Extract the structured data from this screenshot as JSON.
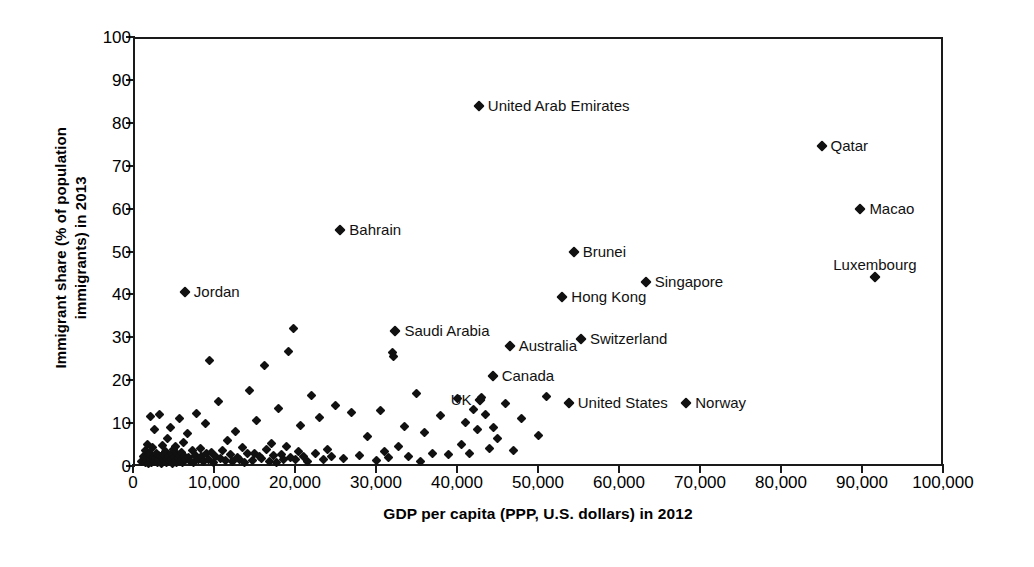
{
  "chart_data": {
    "type": "scatter",
    "title": "",
    "xlabel": "GDP per capita (PPP, U.S. dollars) in 2012",
    "ylabel": "Immigrant share (% of population\nimmigrants) in 2013",
    "ylabel_line1": "Immigrant share (% of population",
    "ylabel_line2": "immigrants) in 2013",
    "xlim": [
      0,
      100000
    ],
    "ylim": [
      0,
      100
    ],
    "xticks": [
      0,
      10000,
      20000,
      30000,
      40000,
      50000,
      60000,
      70000,
      80000,
      90000,
      100000
    ],
    "xtick_labels": [
      "0",
      "10,000",
      "20,000",
      "30,000",
      "40,000",
      "50,000",
      "60,000",
      "70,000",
      "80,000",
      "90,000",
      "100,000"
    ],
    "yticks": [
      0,
      10,
      20,
      30,
      40,
      50,
      60,
      70,
      80,
      90,
      100
    ],
    "ytick_labels": [
      "0",
      "10",
      "20",
      "30",
      "40",
      "50",
      "60",
      "70",
      "80",
      "90",
      "100"
    ],
    "grid": false,
    "legend": null,
    "marker_color": "#111111",
    "marker_shape": "diamond",
    "labeled_points": [
      {
        "name": "United Arab Emirates",
        "x": 42700,
        "y": 84.0,
        "label_side": "right"
      },
      {
        "name": "Qatar",
        "x": 85000,
        "y": 74.5,
        "label_side": "right"
      },
      {
        "name": "Macao",
        "x": 89800,
        "y": 60.0,
        "label_side": "right"
      },
      {
        "name": "Luxembourg",
        "x": 91600,
        "y": 44.0,
        "label_side": "above"
      },
      {
        "name": "Bahrain",
        "x": 25600,
        "y": 55.0,
        "label_side": "right"
      },
      {
        "name": "Brunei",
        "x": 54400,
        "y": 50.0,
        "label_side": "right"
      },
      {
        "name": "Singapore",
        "x": 63300,
        "y": 43.0,
        "label_side": "right"
      },
      {
        "name": "Hong Kong",
        "x": 53000,
        "y": 39.5,
        "label_side": "right"
      },
      {
        "name": "Jordan",
        "x": 6400,
        "y": 40.5,
        "label_side": "right"
      },
      {
        "name": "Saudi Arabia",
        "x": 32400,
        "y": 31.5,
        "label_side": "right"
      },
      {
        "name": "Switzerland",
        "x": 55300,
        "y": 29.5,
        "label_side": "right"
      },
      {
        "name": "Australia",
        "x": 46500,
        "y": 28.0,
        "label_side": "right"
      },
      {
        "name": "Canada",
        "x": 44400,
        "y": 21.0,
        "label_side": "right"
      },
      {
        "name": "UK",
        "x": 42900,
        "y": 15.5,
        "label_side": "left"
      },
      {
        "name": "United States",
        "x": 53800,
        "y": 14.8,
        "label_side": "right"
      },
      {
        "name": "Norway",
        "x": 68300,
        "y": 14.8,
        "label_side": "right"
      }
    ],
    "unlabeled_points": [
      [
        1100,
        1.0
      ],
      [
        1300,
        2.2
      ],
      [
        1500,
        0.8
      ],
      [
        1600,
        3.5
      ],
      [
        1700,
        1.2
      ],
      [
        1800,
        5.0
      ],
      [
        1900,
        0.6
      ],
      [
        2000,
        2.8
      ],
      [
        2100,
        1.5
      ],
      [
        2200,
        11.5
      ],
      [
        2300,
        0.9
      ],
      [
        2400,
        4.2
      ],
      [
        2500,
        2.0
      ],
      [
        2600,
        1.1
      ],
      [
        2700,
        8.5
      ],
      [
        2800,
        1.8
      ],
      [
        2900,
        3.0
      ],
      [
        3000,
        0.7
      ],
      [
        3100,
        2.5
      ],
      [
        3200,
        1.4
      ],
      [
        3300,
        12.0
      ],
      [
        3400,
        2.1
      ],
      [
        3500,
        0.5
      ],
      [
        3600,
        4.8
      ],
      [
        3700,
        1.9
      ],
      [
        3800,
        2.6
      ],
      [
        3900,
        1.0
      ],
      [
        4000,
        3.3
      ],
      [
        4100,
        0.8
      ],
      [
        4200,
        6.5
      ],
      [
        4300,
        1.6
      ],
      [
        4400,
        2.3
      ],
      [
        4500,
        1.2
      ],
      [
        4600,
        9.0
      ],
      [
        4700,
        2.9
      ],
      [
        4800,
        1.5
      ],
      [
        4900,
        0.6
      ],
      [
        5000,
        3.8
      ],
      [
        5100,
        2.0
      ],
      [
        5200,
        1.3
      ],
      [
        5300,
        4.5
      ],
      [
        5400,
        0.9
      ],
      [
        5500,
        2.7
      ],
      [
        5600,
        1.7
      ],
      [
        5700,
        11.0
      ],
      [
        5800,
        2.4
      ],
      [
        5900,
        1.0
      ],
      [
        6000,
        3.2
      ],
      [
        6100,
        0.7
      ],
      [
        6200,
        5.5
      ],
      [
        6300,
        2.2
      ],
      [
        6500,
        1.5
      ],
      [
        6700,
        7.5
      ],
      [
        6900,
        2.0
      ],
      [
        7100,
        1.1
      ],
      [
        7300,
        3.6
      ],
      [
        7500,
        0.8
      ],
      [
        7700,
        2.5
      ],
      [
        7900,
        12.3
      ],
      [
        8100,
        1.4
      ],
      [
        8300,
        4.0
      ],
      [
        8500,
        2.1
      ],
      [
        8700,
        1.0
      ],
      [
        8900,
        9.8
      ],
      [
        9100,
        2.8
      ],
      [
        9300,
        1.6
      ],
      [
        9500,
        24.5
      ],
      [
        9700,
        3.1
      ],
      [
        9900,
        0.9
      ],
      [
        10200,
        2.3
      ],
      [
        10500,
        15.0
      ],
      [
        10800,
        1.8
      ],
      [
        11100,
        3.5
      ],
      [
        11400,
        1.2
      ],
      [
        11700,
        6.0
      ],
      [
        12000,
        2.6
      ],
      [
        12300,
        1.0
      ],
      [
        12600,
        8.0
      ],
      [
        12900,
        2.0
      ],
      [
        13200,
        1.5
      ],
      [
        13500,
        4.3
      ],
      [
        13800,
        0.8
      ],
      [
        14100,
        2.9
      ],
      [
        14400,
        17.5
      ],
      [
        14700,
        1.3
      ],
      [
        15000,
        3.0
      ],
      [
        15300,
        10.5
      ],
      [
        15600,
        2.2
      ],
      [
        15900,
        1.7
      ],
      [
        16200,
        23.5
      ],
      [
        16500,
        3.8
      ],
      [
        16800,
        1.1
      ],
      [
        17100,
        5.2
      ],
      [
        17400,
        2.4
      ],
      [
        17700,
        0.9
      ],
      [
        18000,
        13.5
      ],
      [
        18300,
        2.7
      ],
      [
        18600,
        1.4
      ],
      [
        18900,
        4.6
      ],
      [
        19200,
        26.8
      ],
      [
        19500,
        2.0
      ],
      [
        19800,
        32.0
      ],
      [
        20100,
        1.6
      ],
      [
        20400,
        3.3
      ],
      [
        20700,
        9.5
      ],
      [
        21000,
        2.1
      ],
      [
        21500,
        1.0
      ],
      [
        22000,
        16.5
      ],
      [
        22500,
        2.8
      ],
      [
        23000,
        11.2
      ],
      [
        23500,
        1.5
      ],
      [
        24000,
        3.9
      ],
      [
        24500,
        2.2
      ],
      [
        25000,
        14.0
      ],
      [
        26000,
        1.8
      ],
      [
        27000,
        12.5
      ],
      [
        28000,
        2.5
      ],
      [
        29000,
        6.8
      ],
      [
        30000,
        1.2
      ],
      [
        30500,
        13.0
      ],
      [
        31000,
        3.4
      ],
      [
        31500,
        2.0
      ],
      [
        32000,
        26.5
      ],
      [
        32200,
        25.5
      ],
      [
        32800,
        4.5
      ],
      [
        33500,
        9.2
      ],
      [
        34000,
        2.3
      ],
      [
        35000,
        17.0
      ],
      [
        35500,
        1.0
      ],
      [
        36000,
        7.8
      ],
      [
        37000,
        3.0
      ],
      [
        38000,
        11.8
      ],
      [
        39000,
        2.6
      ],
      [
        40000,
        15.8
      ],
      [
        40500,
        5.0
      ],
      [
        41000,
        10.2
      ],
      [
        41500,
        2.8
      ],
      [
        42000,
        13.2
      ],
      [
        42500,
        8.5
      ],
      [
        43000,
        16.0
      ],
      [
        43500,
        12.0
      ],
      [
        44000,
        4.0
      ],
      [
        44500,
        9.0
      ],
      [
        45000,
        6.5
      ],
      [
        46000,
        14.5
      ],
      [
        47000,
        3.5
      ],
      [
        48000,
        11.0
      ],
      [
        50000,
        7.0
      ],
      [
        51000,
        16.2
      ]
    ]
  }
}
